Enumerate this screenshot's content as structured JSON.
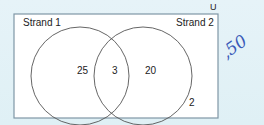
{
  "diagram": {
    "type": "venn",
    "universe_label": "U",
    "sets": [
      {
        "name": "Strand 1",
        "only_count": "25"
      },
      {
        "name": "Strand 2",
        "only_count": "20"
      }
    ],
    "intersection_count": "3",
    "outside_count": "2",
    "annotation": ",50",
    "colors": {
      "background": "#e2f1f6",
      "box_fill": "#ffffff",
      "box_border": "#7f97a6",
      "circle_stroke": "#555555",
      "annotation_ink": "#3a5ab8"
    }
  }
}
